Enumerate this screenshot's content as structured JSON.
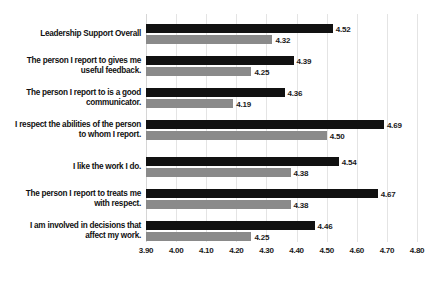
{
  "chart_data": {
    "type": "bar",
    "orientation": "horizontal",
    "title": "",
    "xlabel": "",
    "ylabel": "",
    "xlim": [
      3.9,
      4.8
    ],
    "grid": true,
    "legend": "none",
    "tick_labels": [
      "3.90",
      "4.00",
      "4.10",
      "4.20",
      "4.30",
      "4.40",
      "4.50",
      "4.60",
      "4.70",
      "4.80"
    ],
    "tick_values": [
      3.9,
      4.0,
      4.1,
      4.2,
      4.3,
      4.4,
      4.5,
      4.6,
      4.7,
      4.8
    ],
    "categories": [
      "Leadership Support Overall",
      "The person I report to gives me useful feedback.",
      "The person I report to is a good communicator.",
      "I respect the abilities of the person to whom I report.",
      "I like the work I do.",
      "The person I report to treats me with respect.",
      "I am involved in decisions that affect my work."
    ],
    "category_lines": [
      [
        "Leadership Support Overall"
      ],
      [
        "The person I report to gives me",
        "useful feedback."
      ],
      [
        "The person I report to is a good",
        "communicator."
      ],
      [
        "I respect the abilities of the person",
        "to whom I report."
      ],
      [
        "I like the work I do."
      ],
      [
        "The person I report to treats me",
        "with respect."
      ],
      [
        "I am involved in decisions that",
        "affect my work."
      ]
    ],
    "series": [
      {
        "name": "series-dark",
        "color": "#111111",
        "values": [
          4.52,
          4.39,
          4.36,
          4.69,
          4.54,
          4.67,
          4.46
        ],
        "labels": [
          "4.52",
          "4.39",
          "4.36",
          "4.69",
          "4.54",
          "4.67",
          "4.46"
        ]
      },
      {
        "name": "series-light",
        "color": "#8a8a8a",
        "values": [
          4.32,
          4.25,
          4.19,
          4.5,
          4.38,
          4.38,
          4.25
        ],
        "labels": [
          "4.32",
          "4.25",
          "4.19",
          "4.50",
          "4.38",
          "4.38",
          "4.25"
        ]
      }
    ]
  }
}
